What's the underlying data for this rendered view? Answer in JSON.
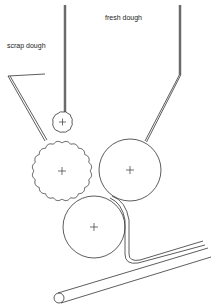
{
  "diagram": {
    "title": "",
    "labels": {
      "scrap_dough": "scrap dough",
      "fresh_dough": "fresh dough"
    },
    "components": [
      {
        "id": "scrap-chute",
        "type": "hopper",
        "label_ref": "scrap_dough"
      },
      {
        "id": "fresh-chute",
        "type": "hopper",
        "label_ref": "fresh_dough"
      },
      {
        "id": "feed-rod",
        "type": "vertical-feed"
      },
      {
        "id": "small-gear-roller",
        "type": "toothed-roller",
        "size": "small"
      },
      {
        "id": "large-gear-roller",
        "type": "toothed-roller",
        "size": "large"
      },
      {
        "id": "right-smooth-roller",
        "type": "smooth-roller"
      },
      {
        "id": "bottom-smooth-roller",
        "type": "smooth-roller"
      },
      {
        "id": "dough-sheet",
        "type": "sheet-output"
      },
      {
        "id": "conveyor-belt",
        "type": "conveyor"
      }
    ],
    "colors": {
      "stroke": "#333333",
      "background": "#ffffff"
    }
  }
}
